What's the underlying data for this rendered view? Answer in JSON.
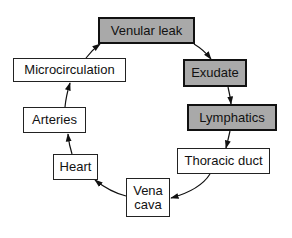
{
  "diagram": {
    "type": "cycle-flow",
    "colors": {
      "emphasis_fill": "#a9a9a9",
      "normal_fill": "#ffffff",
      "stroke": "#111111"
    },
    "nodes": {
      "venular_leak": {
        "label": "Venular leak",
        "emphasized": true
      },
      "exudate": {
        "label": "Exudate",
        "emphasized": true
      },
      "lymphatics": {
        "label": "Lymphatics",
        "emphasized": true
      },
      "thoracic_duct": {
        "label": "Thoracic duct",
        "emphasized": false
      },
      "vena_cava": {
        "label": "Vena\ncava",
        "emphasized": false
      },
      "heart": {
        "label": "Heart",
        "emphasized": false
      },
      "arteries": {
        "label": "Arteries",
        "emphasized": false
      },
      "microcirculation": {
        "label": "Microcirculation",
        "emphasized": false
      }
    },
    "edges": [
      {
        "from": "venular_leak",
        "to": "exudate"
      },
      {
        "from": "exudate",
        "to": "lymphatics"
      },
      {
        "from": "lymphatics",
        "to": "thoracic_duct"
      },
      {
        "from": "thoracic_duct",
        "to": "vena_cava"
      },
      {
        "from": "vena_cava",
        "to": "heart"
      },
      {
        "from": "heart",
        "to": "arteries"
      },
      {
        "from": "arteries",
        "to": "microcirculation"
      },
      {
        "from": "microcirculation",
        "to": "venular_leak"
      }
    ]
  }
}
